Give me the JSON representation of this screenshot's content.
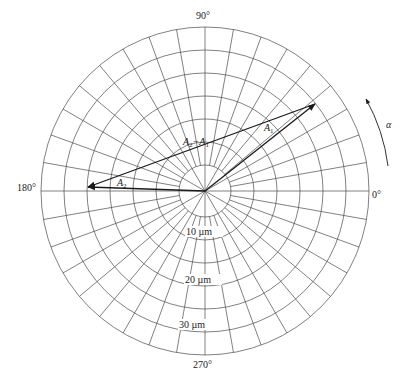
{
  "diagram": {
    "type": "polar-vector-diagram",
    "center": {
      "x": 205,
      "y": 191
    },
    "ring_radii_px": [
      26,
      49,
      72,
      95,
      118,
      141,
      164
    ],
    "ring_values_um": [
      5,
      10,
      15,
      20,
      25,
      30,
      35
    ],
    "spokes": {
      "inner_step_deg": 30,
      "outer_step_deg": 10
    },
    "angle_labels": [
      {
        "id": "deg-0",
        "text": "0°",
        "x": 372,
        "y": 198
      },
      {
        "id": "deg-90",
        "text": "90°",
        "x": 196,
        "y": 19
      },
      {
        "id": "deg-180",
        "text": "180°",
        "x": 17,
        "y": 191
      },
      {
        "id": "deg-270",
        "text": "270°",
        "x": 193,
        "y": 368
      }
    ],
    "radius_labels": [
      {
        "id": "r-10",
        "text": "10 µm",
        "x": 186,
        "y": 235
      },
      {
        "id": "r-20",
        "text": "20 µm",
        "x": 185,
        "y": 283
      },
      {
        "id": "r-30",
        "text": "30 µm",
        "x": 179,
        "y": 328
      }
    ],
    "vectors": [
      {
        "id": "A1",
        "label": "A",
        "sub": "1",
        "magnitude_um": 30,
        "angle_deg": 38,
        "from": [
          205,
          191
        ],
        "to": [
          315,
          104
        ],
        "label_pos": [
          264,
          131
        ]
      },
      {
        "id": "A2",
        "label": "A",
        "sub": "2",
        "magnitude_um": 25,
        "angle_deg": 178,
        "from": [
          205,
          191
        ],
        "to": [
          88,
          187
        ],
        "label_pos": [
          117,
          186
        ]
      },
      {
        "id": "A2-A1",
        "label": "A",
        "sub": "2",
        "label2": "−A",
        "sub2": "1",
        "from": [
          315,
          104
        ],
        "to": [
          88,
          187
        ],
        "label_pos": [
          183,
          145
        ]
      }
    ],
    "rotation": {
      "symbol": "α",
      "direction": "counter-clockwise",
      "label_pos": [
        386,
        128
      ]
    }
  }
}
